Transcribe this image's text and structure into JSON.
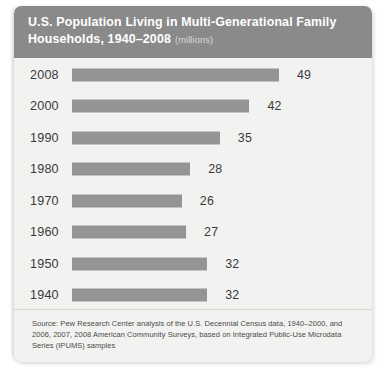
{
  "header": {
    "title_line1": "U.S. Population Living in Multi-Generational Family",
    "title_line2": "Households, 1940–2008",
    "units": "(millions)"
  },
  "footer": {
    "source": "Source: Pew Research Center analysis of the U.S. Decennial Census data, 1940–2000, and 2006, 2007, 2008 American Community Surveys, based on Integrated Public-Use Microdata Series (IPUMS) samples"
  },
  "colors": {
    "bar": "#949494",
    "header_band": "#8a8a8a",
    "card_background": "#f2f2f0",
    "title_text": "#ffffff",
    "label_text": "#3a3a3a"
  },
  "chart_data": {
    "type": "bar",
    "orientation": "horizontal",
    "xlabel": "",
    "ylabel": "",
    "units": "millions",
    "grid": false,
    "legend": false,
    "xlim": [
      0,
      58
    ],
    "categories": [
      "2008",
      "2000",
      "1990",
      "1980",
      "1970",
      "1960",
      "1950",
      "1940"
    ],
    "values": [
      49,
      42,
      35,
      28,
      26,
      27,
      32,
      32
    ],
    "value_labels": [
      "49",
      "42",
      "35",
      "28",
      "26",
      "27",
      "32",
      "32"
    ],
    "series": [
      {
        "name": "Population in multi-generational family households",
        "values": [
          49,
          42,
          35,
          28,
          26,
          27,
          32,
          32
        ]
      }
    ]
  }
}
